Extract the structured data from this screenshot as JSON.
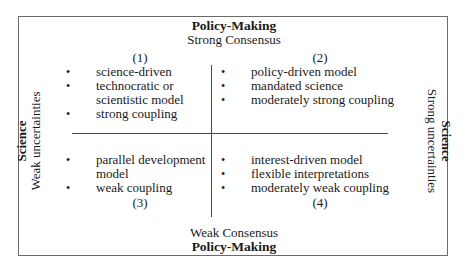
{
  "diagram": {
    "top_axis": {
      "title": "Policy-Making",
      "subtitle": "Strong Consensus"
    },
    "bottom_axis": {
      "subtitle": "Weak Consensus",
      "title": "Policy-Making"
    },
    "left_axis": {
      "title": "Science",
      "subtitle": "Weak uncertainties"
    },
    "right_axis": {
      "title": "Science",
      "subtitle": "Strong uncertainties"
    },
    "quadrants": [
      {
        "number": "(1)",
        "items": [
          "science-driven",
          "technocratic or",
          "scientistic model",
          "strong coupling"
        ]
      },
      {
        "number": "(2)",
        "items": [
          "policy-driven model",
          "mandated science",
          "moderately strong coupling"
        ]
      },
      {
        "number": "(3)",
        "items": [
          "parallel development",
          "model",
          "weak coupling"
        ]
      },
      {
        "number": "(4)",
        "items": [
          "interest-driven model",
          "flexible interpretations",
          "moderately weak coupling"
        ]
      }
    ]
  }
}
